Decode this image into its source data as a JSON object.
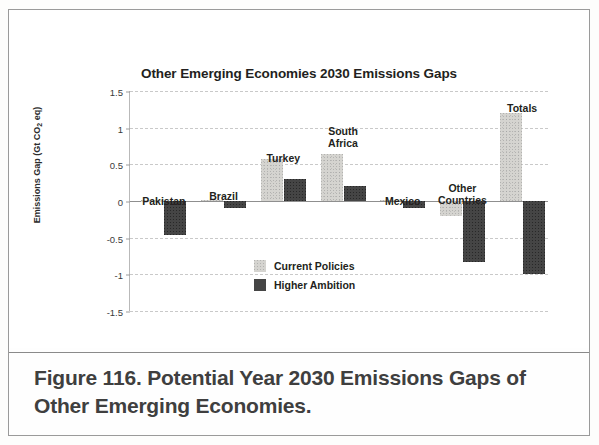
{
  "figure": {
    "caption": "Figure 116. Potential Year 2030 Emissions Gaps of Other Emerging Economies."
  },
  "chart_data": {
    "type": "bar",
    "title": "Other Emerging Economies 2030 Emissions Gaps",
    "xlabel": "",
    "ylabel": "Emissions Gap (Gt CO",
    "ylabel_sub": "2",
    "ylabel_tail": " eq)",
    "ylim": [
      -1.5,
      1.5
    ],
    "yticks": [
      "1.5",
      "1",
      "0.5",
      "0",
      "-0.5",
      "-1",
      "-1.5"
    ],
    "ytick_values": [
      1.5,
      1,
      0.5,
      0,
      -0.5,
      -1,
      -1.5
    ],
    "grid": true,
    "legend_position": "inside-center-bottom",
    "categories": [
      "Pakistan",
      "Brazil",
      "Turkey",
      "South\nAfrica",
      "Mexico",
      "Other\nCountries",
      "Totals"
    ],
    "series": [
      {
        "name": "Current Policies",
        "color": "#d5d4d0",
        "values": [
          0.01,
          0.02,
          0.57,
          0.64,
          0.02,
          -0.2,
          1.2
        ]
      },
      {
        "name": "Higher Ambition",
        "color": "#454545",
        "values": [
          -0.46,
          -0.1,
          0.3,
          0.21,
          -0.09,
          -0.83,
          -1.0
        ]
      }
    ]
  },
  "legend": {
    "items": [
      {
        "label": "Current Policies",
        "swatch": "light"
      },
      {
        "label": "Higher Ambition",
        "swatch": "dark"
      }
    ]
  }
}
